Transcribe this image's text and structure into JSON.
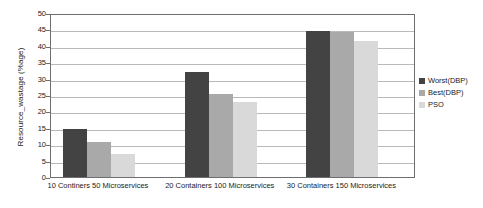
{
  "chart_data": {
    "type": "bar",
    "title": "",
    "subtitle": "",
    "xlabel": "",
    "ylabel": "Resource_wastage (%age)",
    "ylim": [
      0,
      50
    ],
    "ytick_step": 5,
    "yticks": [
      0,
      5,
      10,
      15,
      20,
      25,
      30,
      35,
      40,
      45,
      50
    ],
    "grid": true,
    "legend_position": "right",
    "categories": [
      "10 Continers 50 Microservices",
      "20 Containers 100 Microservices",
      "30 Containers 150 Microservices"
    ],
    "series": [
      {
        "name": "Worst(DBP)",
        "color": "#434343",
        "values": [
          14.6,
          32.0,
          44.5
        ]
      },
      {
        "name": "Best(DBP)",
        "color": "#a9a9a9",
        "values": [
          10.7,
          25.4,
          44.1
        ]
      },
      {
        "name": "PSO",
        "color": "#d9d9d9",
        "values": [
          7.1,
          22.8,
          41.4
        ]
      }
    ],
    "annotations": []
  },
  "axis": {
    "y_title": "Resource_wastage (%age)",
    "tick_labels": [
      "50",
      "45",
      "40",
      "35",
      "30",
      "25",
      "20",
      "15",
      "10",
      "5",
      "0"
    ]
  },
  "legend": {
    "items": [
      {
        "label": "Worst(DBP)"
      },
      {
        "label": "Best(DBP)"
      },
      {
        "label": "PSO"
      }
    ]
  },
  "colors": {
    "series_worst": "#434343",
    "series_best": "#a9a9a9",
    "series_pso": "#d9d9d9",
    "gridline": "#b9b9b9",
    "axis": "#6e6e6e",
    "text": "#1a1a1a",
    "background": "#ffffff"
  }
}
